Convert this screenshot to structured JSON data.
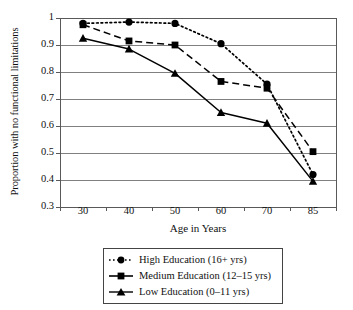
{
  "chart_data": {
    "type": "line",
    "title": "",
    "subtitle": "",
    "xlabel": "Age in Years",
    "ylabel": "Proportion with no functional limitations",
    "categories": [
      "30",
      "40",
      "50",
      "60",
      "70",
      "85"
    ],
    "ylim": [
      0.3,
      1.0
    ],
    "yticks": [
      "0.3",
      "0.4",
      "0.5",
      "0.6",
      "0.7",
      "0.8",
      "0.9",
      "1"
    ],
    "ytick_values": [
      0.3,
      0.4,
      0.5,
      0.6,
      0.7,
      0.8,
      0.9,
      1.0
    ],
    "grid": "horizontal",
    "legend_position": "below-plot",
    "series": [
      {
        "name": "High Education (16+ yrs)",
        "values": [
          0.98,
          0.985,
          0.98,
          0.905,
          0.755,
          0.42
        ],
        "marker": "circle",
        "linestyle": "dotted",
        "color": "#000000"
      },
      {
        "name": "Medium Education (12–15 yrs)",
        "values": [
          0.975,
          0.915,
          0.9,
          0.765,
          0.74,
          0.505
        ],
        "marker": "square",
        "linestyle": "dashed",
        "color": "#000000"
      },
      {
        "name": "Low Education (0–11 yrs)",
        "values": [
          0.925,
          0.885,
          0.795,
          0.65,
          0.61,
          0.395
        ],
        "marker": "triangle",
        "linestyle": "solid",
        "color": "#000000"
      }
    ]
  },
  "legend": {
    "items": [
      {
        "label": "High Education (16+ yrs)"
      },
      {
        "label": "Medium Education (12–15 yrs)"
      },
      {
        "label": "Low Education (0–11 yrs)"
      }
    ]
  },
  "axes": {
    "x_title": "Age in Years",
    "y_title": "Proportion with no functional limitations",
    "x_ticks": [
      "30",
      "40",
      "50",
      "60",
      "70",
      "85"
    ],
    "y_ticks": [
      "1",
      "0.9",
      "0.8",
      "0.7",
      "0.6",
      "0.5",
      "0.4",
      "0.3"
    ]
  },
  "colors": {
    "line": "#000000",
    "grid": "#808080",
    "frame": "#595959",
    "background": "#ffffff"
  }
}
